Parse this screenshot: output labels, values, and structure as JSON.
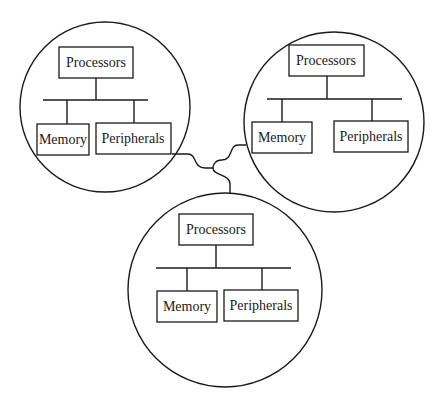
{
  "diagram": {
    "type": "distributed-system-nodes",
    "colors": {
      "line": "#1a1a1a",
      "background": "#ffffff"
    },
    "nodes": [
      {
        "id": "node-top-left",
        "processors_label": "Processors",
        "memory_label": "Memory",
        "peripherals_label": "Peripherals"
      },
      {
        "id": "node-top-right",
        "processors_label": "Processors",
        "memory_label": "Memory",
        "peripherals_label": "Peripherals"
      },
      {
        "id": "node-bottom",
        "processors_label": "Processors",
        "memory_label": "Memory",
        "peripherals_label": "Peripherals"
      }
    ],
    "connections": [
      {
        "from": "node-top-left",
        "to": "node-bottom"
      },
      {
        "from": "node-top-right",
        "to": "node-bottom"
      }
    ]
  }
}
